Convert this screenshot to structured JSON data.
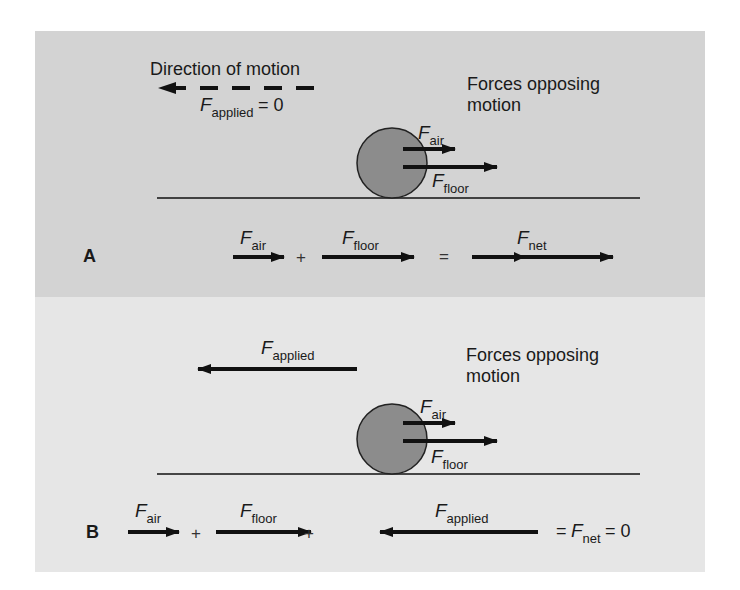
{
  "panel_a": {
    "label": "A",
    "direction_text": "Direction of motion",
    "applied": {
      "symbol": "F",
      "sub": "applied",
      "eq": "= 0"
    },
    "opposing_text_1": "Forces opposing",
    "opposing_text_2": "motion",
    "ball_labels": {
      "air": {
        "symbol": "F",
        "sub": "air"
      },
      "floor": {
        "symbol": "F",
        "sub": "floor"
      }
    },
    "equation": {
      "air": {
        "symbol": "F",
        "sub": "air"
      },
      "plus": "+",
      "floor": {
        "symbol": "F",
        "sub": "floor"
      },
      "equals": "=",
      "net": {
        "symbol": "F",
        "sub": "net"
      }
    }
  },
  "panel_b": {
    "label": "B",
    "applied": {
      "symbol": "F",
      "sub": "applied"
    },
    "opposing_text_1": "Forces opposing",
    "opposing_text_2": "motion",
    "ball_labels": {
      "air": {
        "symbol": "F",
        "sub": "air"
      },
      "floor": {
        "symbol": "F",
        "sub": "floor"
      }
    },
    "equation": {
      "air": {
        "symbol": "F",
        "sub": "air"
      },
      "plus1": "+",
      "floor": {
        "symbol": "F",
        "sub": "floor"
      },
      "plus2": "+",
      "applied": {
        "symbol": "F",
        "sub": "applied"
      },
      "eq_prefix": "=",
      "net": {
        "symbol": "F",
        "sub": "net"
      },
      "eq_suffix": "= 0"
    }
  },
  "colors": {
    "panel_a_bg": "#d3d3d3",
    "panel_b_bg": "#e6e6e6",
    "ball_fill": "#8c8c8c",
    "arrow": "#111111"
  }
}
